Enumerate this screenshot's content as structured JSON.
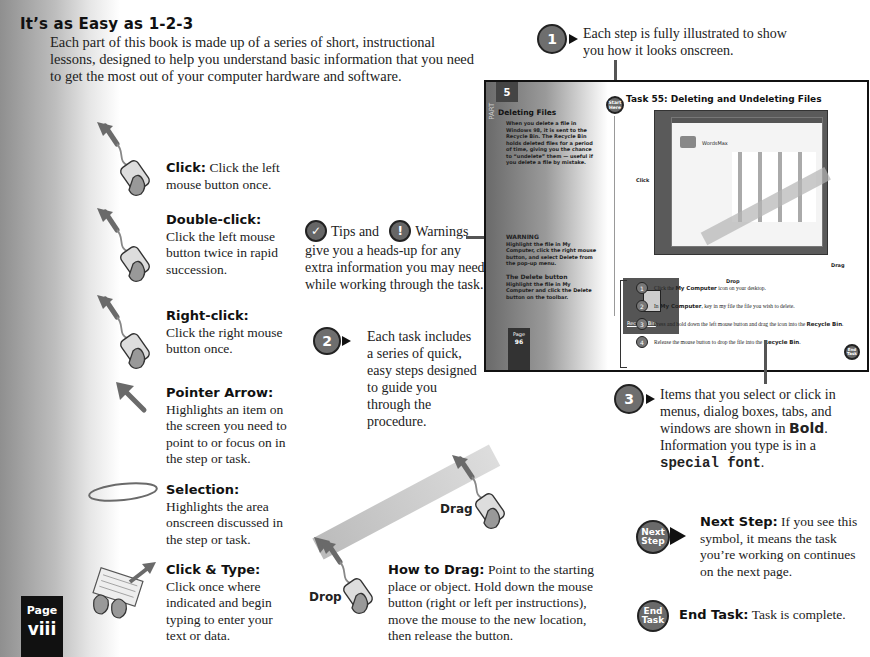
{
  "header": {
    "title": "It’s as Easy as 1-2-3",
    "intro": "Each part of this book is made up of a series of short, instructional lessons, designed to help you understand basic information that you need to get the most out of your computer hardware and software."
  },
  "legend": [
    {
      "icon": "mouse-click-icon",
      "term": "Click:",
      "text": "Click the left mouse button once."
    },
    {
      "icon": "mouse-double-click-icon",
      "term": "Double-click:",
      "text": "Click the left mouse button twice in rapid succession."
    },
    {
      "icon": "mouse-right-click-icon",
      "term": "Right-click:",
      "text": "Click the right mouse button once."
    },
    {
      "icon": "pointer-arrow-icon",
      "term": "Pointer Arrow:",
      "text": "Highlights an item on the screen you need to point to or focus on in the step or task."
    },
    {
      "icon": "selection-ellipse-icon",
      "term": "Selection:",
      "text": "Highlights the area onscreen discussed in the step or task."
    },
    {
      "icon": "keyboard-type-icon",
      "term": "Click & Type:",
      "text": "Click once where indicated and begin typing to enter your text or data."
    }
  ],
  "callouts": {
    "one": {
      "number": "1",
      "text": "Each step is fully illustrated to show you how it looks onscreen."
    },
    "tips": {
      "tips_label": "Tips and",
      "warnings_label": "Warnings",
      "text": "give you a heads-up for any extra information you may need while working through the task."
    },
    "two": {
      "number": "2",
      "text": "Each task includes a series of quick, easy steps designed to guide you through the procedure."
    },
    "three": {
      "number": "3",
      "text_a": "Items that you select or click in menus, dialog boxes, tabs, and windows are shown in",
      "bold_word": "Bold",
      "text_b": ". Information you type is in a",
      "special_word": "special font",
      "text_c": "."
    }
  },
  "drag": {
    "drag_label": "Drag",
    "drop_label": "Drop",
    "term": "How to Drag:",
    "text": "Point to the starting place or object. Hold down the mouse button (right or left per instructions), move the mouse to the new location, then release the button."
  },
  "symbols": [
    {
      "icon_text": "Next Step",
      "term": "Next Step:",
      "text": "If you see this symbol, it means the task you’re working on continues on the next page."
    },
    {
      "icon_text": "End Task",
      "term": "End Task:",
      "text": "Task is complete."
    }
  ],
  "sample_page": {
    "part_number": "5",
    "part_label": "PART",
    "side_heading": "Deleting Files",
    "side_body": "When you delete a file in Windows 98, it is sent to the Recycle Bin. The Recycle Bin holds deleted files for a period of time, giving you the chance to “undelete” them — useful if you delete a file by mistake.",
    "warning_heading": "WARNING",
    "warning_body": "Highlight the file in My Computer, click the right mouse button, and select Delete from the pop-up menu.",
    "tip_heading": "The Delete button",
    "tip_body": "Highlight the file in My Computer and click the Delete button on the toolbar.",
    "page_label": "Page",
    "page_number": "96",
    "start_badge": "Start Here",
    "end_badge": "End Task",
    "task_title": "Task 55: Deleting and Undeleting Files",
    "screen_window_title": "WordsMax",
    "click_label": "Click",
    "drag_label": "Drag",
    "drop_label": "Drop",
    "recycle_label": "Recycle Bin",
    "steps": [
      {
        "n": "1",
        "pre": "Click the",
        "bold": "My Computer",
        "post": "icon on your desktop."
      },
      {
        "n": "2",
        "pre": "In",
        "bold": "My Computer",
        "post": ", key in my file the file you wish to delete."
      },
      {
        "n": "3",
        "pre": "Press and hold down the left mouse button and drag the icon into the",
        "bold": "Recycle Bin",
        "post": "."
      },
      {
        "n": "4",
        "pre": "Release the mouse button to drop the file into the",
        "bold": "Recycle Bin",
        "post": "."
      }
    ]
  },
  "footer": {
    "page_label": "Page",
    "page_number": "viii"
  }
}
